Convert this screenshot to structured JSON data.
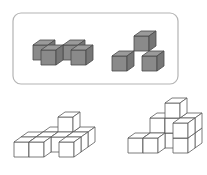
{
  "figure": {
    "frame": {
      "x": 13,
      "y": 13,
      "width": 165,
      "height": 71,
      "radius": 8,
      "stroke": "#b4b4b4"
    },
    "colors": {
      "shaded_front": "#8a8a8a",
      "shaded_top": "#9a9a9a",
      "shaded_side": "#767676",
      "shaded_edge": "#4a4a4a",
      "outline_edge": "#5a5a5a",
      "background": "#ffffff"
    },
    "cube": {
      "face_w": 15,
      "face_h": 15,
      "depth_dx": 7,
      "depth_dy": -5
    },
    "pieces": [
      {
        "name": "piece-a",
        "style": "solid",
        "origin": [
          26,
          50
        ],
        "cubes": [
          [
            0,
            0,
            1
          ],
          [
            1,
            0,
            0
          ],
          [
            2,
            0,
            1
          ],
          [
            3,
            0,
            0
          ]
        ],
        "note": "4 cubes: zig-zag S/Z tetromino lying flat"
      },
      {
        "name": "piece-b",
        "style": "solid",
        "origin": [
          112,
          56
        ],
        "cubes": [
          [
            1,
            1,
            1
          ],
          [
            0,
            0,
            0
          ],
          [
            2,
            0,
            0
          ]
        ],
        "note": "3 cubes: two on the ground, one on top in back-centre"
      }
    ],
    "structures": [
      {
        "name": "structure-left",
        "style": "line",
        "origin": [
          14,
          142
        ],
        "cubes": [
          [
            1,
            0,
            2
          ],
          [
            2,
            0,
            2
          ],
          [
            3,
            0,
            2
          ],
          [
            0,
            0,
            1
          ],
          [
            1,
            0,
            1
          ],
          [
            2,
            0,
            1
          ],
          [
            3,
            0,
            1
          ],
          [
            0,
            0,
            0
          ],
          [
            1,
            0,
            0
          ],
          [
            3,
            0,
            0
          ],
          [
            2,
            1,
            2
          ]
        ],
        "note": "outline structure, bottom-left"
      },
      {
        "name": "structure-right",
        "style": "line",
        "origin": [
          128,
          138
        ],
        "cubes": [
          [
            1,
            0,
            1
          ],
          [
            1,
            1,
            1
          ],
          [
            2,
            0,
            1
          ],
          [
            2,
            1,
            1
          ],
          [
            2,
            2,
            1
          ],
          [
            3,
            0,
            1
          ],
          [
            3,
            1,
            1
          ],
          [
            0,
            0,
            0
          ],
          [
            1,
            0,
            0
          ],
          [
            3,
            0,
            0
          ],
          [
            3,
            1,
            0
          ]
        ],
        "note": "outline structure, bottom-right"
      }
    ]
  }
}
